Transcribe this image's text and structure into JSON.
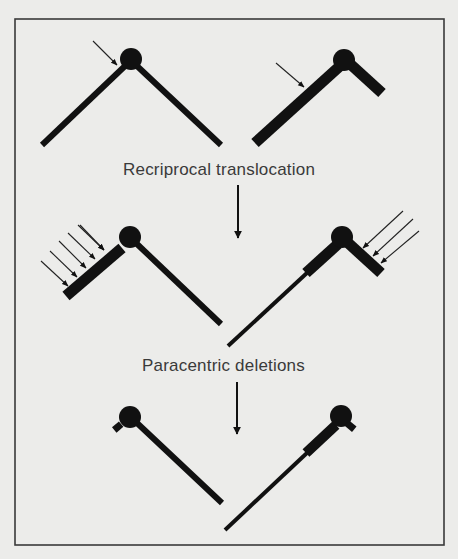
{
  "figure": {
    "background": "#ececea",
    "ink_color": "#111111",
    "frame": {
      "x": 15,
      "y": 19,
      "width": 429,
      "height": 526,
      "color": "#3a3a3a"
    }
  },
  "labels": {
    "step1": "Recriprocal translocation",
    "step2": "Paracentric deletions"
  },
  "stages": [
    {
      "name": "original-chromosomes",
      "chromosomes": [
        {
          "side": "left",
          "centromere": [
            131,
            59
          ],
          "arms": [
            "long thin left arm",
            "long thin right arm"
          ],
          "break_arrows": 1
        },
        {
          "side": "right",
          "centromere": [
            344,
            61
          ],
          "arms": [
            "long thick left arm",
            "short thick right arm"
          ],
          "break_arrows": 1
        }
      ]
    },
    {
      "name": "after-translocation",
      "chromosomes": [
        {
          "side": "left",
          "centromere": [
            130,
            237
          ],
          "deletion_arrows": 6
        },
        {
          "side": "right",
          "centromere": [
            342,
            237
          ],
          "deletion_arrows": 3
        }
      ]
    },
    {
      "name": "after-deletions",
      "chromosomes": [
        {
          "side": "left",
          "centromere": [
            130,
            418
          ]
        },
        {
          "side": "right",
          "centromere": [
            340,
            418
          ]
        }
      ]
    }
  ]
}
